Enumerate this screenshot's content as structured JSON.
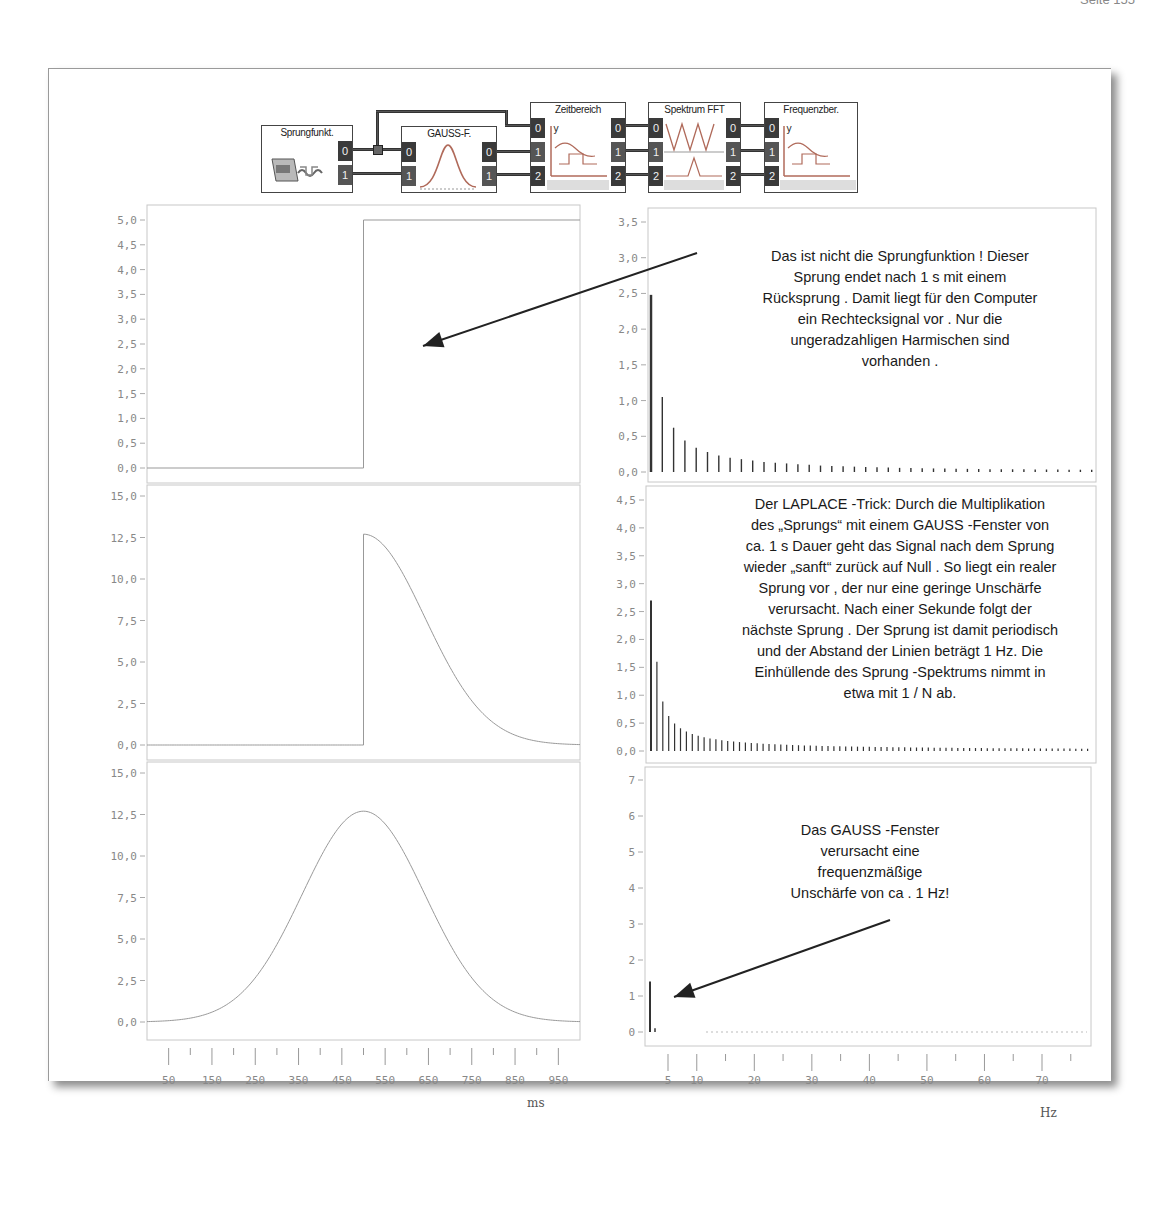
{
  "page": {
    "header_left": "",
    "header_right": "Seite 155"
  },
  "block_diagram": {
    "blocks": [
      {
        "title": "Sprungfunkt.",
        "inputs": [],
        "outputs": [
          "0",
          "1"
        ],
        "icon": "step-function-plug-icon"
      },
      {
        "title": "GAUSS-F.",
        "inputs": [
          "0",
          "1"
        ],
        "outputs": [
          "0",
          "1"
        ],
        "icon": "gauss-curve-icon"
      },
      {
        "title": "Zeitbereich",
        "inputs": [
          "0",
          "1",
          "2"
        ],
        "outputs": [
          "0",
          "1",
          "2"
        ],
        "icon": "time-domain-plot-icon"
      },
      {
        "title": "Spektrum FFT",
        "inputs": [
          "0",
          "1",
          "2"
        ],
        "outputs": [
          "0",
          "1",
          "2"
        ],
        "icon": "fft-spectrum-icon"
      },
      {
        "title": "Frequenzber.",
        "inputs": [
          "0",
          "1",
          "2"
        ],
        "outputs": [],
        "icon": "frequency-domain-plot-icon"
      }
    ]
  },
  "annotations": {
    "top": [
      "Das ist nicht die Sprungfunktion   ! Dieser",
      "Sprung endet nach    1 s mit einem",
      "Rücksprung . Damit liegt für den Computer",
      "ein Rechtecksignal vor  . Nur die",
      "ungeradzahligen Harmischen sind",
      "vorhanden ."
    ],
    "middle": [
      "Der LAPLACE -Trick: Durch die Multiplikation",
      "des „Sprungs“ mit einem GAUSS  -Fenster von",
      "ca. 1 s Dauer geht das Signal nach dem Sprung",
      "wieder „sanft“ zurück auf Null  . So liegt ein realer",
      "Sprung vor  , der nur eine geringe Unschärfe",
      "verursacht. Nach einer Sekunde folgt der",
      "nächste Sprung  . Der Sprung ist damit periodisch",
      "und der Abstand der Linien beträgt     1 Hz. Die",
      "Einhüllende des Sprung   -Spektrums nimmt in",
      "etwa mit 1 / N ab."
    ],
    "bottom": [
      "Das GAUSS -Fenster",
      "verursacht eine",
      "frequenzmäßige",
      "Unschärfe von ca . 1 Hz!"
    ]
  },
  "axes": {
    "time_unit": "ms",
    "freq_unit": "Hz"
  },
  "chart_data": [
    {
      "id": "time-step",
      "type": "line",
      "title": "",
      "xlabel": "ms",
      "ylabel": "",
      "xlim": [
        0,
        1000
      ],
      "ylim": [
        -0.3,
        5.2
      ],
      "yticks": [
        "0,0",
        "0,5",
        "1,0",
        "1,5",
        "2,0",
        "2,5",
        "3,0",
        "3,5",
        "4,0",
        "4,5",
        "5,0"
      ],
      "yticks_values": [
        0,
        0.5,
        1,
        1.5,
        2,
        2.5,
        3,
        3.5,
        4,
        4.5,
        5
      ],
      "series": [
        {
          "name": "Sprungfunktion",
          "x": [
            0,
            500,
            500,
            1000
          ],
          "y": [
            0,
            0,
            5,
            5
          ]
        }
      ],
      "grid": false
    },
    {
      "id": "time-step-gauss",
      "type": "line",
      "title": "",
      "xlabel": "ms",
      "ylabel": "",
      "xlim": [
        0,
        1000
      ],
      "ylim": [
        -0.6,
        15.6
      ],
      "yticks": [
        "0,0",
        "2,5",
        "5,0",
        "7,5",
        "10,0",
        "12,5",
        "15,0"
      ],
      "yticks_values": [
        0,
        2.5,
        5,
        7.5,
        10,
        12.5,
        15
      ],
      "series": [
        {
          "name": "Sprung × GAUSS-Fenster",
          "formula": "x<500 ? 0 : 12.7*exp(-((x-500)/200)^2)",
          "peak": 12.7,
          "step_at": 500
        }
      ],
      "grid": false
    },
    {
      "id": "time-gauss",
      "type": "line",
      "title": "",
      "xlabel": "ms",
      "ylabel": "",
      "xlim": [
        0,
        1000
      ],
      "ylim": [
        -0.6,
        15.6
      ],
      "yticks": [
        "0,0",
        "2,5",
        "5,0",
        "7,5",
        "10,0",
        "12,5",
        "15,0"
      ],
      "yticks_values": [
        0,
        2.5,
        5,
        7.5,
        10,
        12.5,
        15
      ],
      "xticks": [
        "50",
        "150",
        "250",
        "350",
        "450",
        "550",
        "650",
        "750",
        "850",
        "950"
      ],
      "xticks_values": [
        50,
        150,
        250,
        350,
        450,
        550,
        650,
        750,
        850,
        950
      ],
      "series": [
        {
          "name": "GAUSS-Fenster",
          "formula": "12.7*exp(-((x-500)/200)^2)",
          "peak": 12.7,
          "center": 500
        }
      ],
      "grid": false
    },
    {
      "id": "spectrum-step",
      "type": "bar",
      "title": "",
      "xlabel": "Hz",
      "ylabel": "",
      "xlim": [
        0,
        78
      ],
      "ylim": [
        0,
        3.6
      ],
      "yticks": [
        "0,0",
        "0,5",
        "1,0",
        "1,5",
        "2,0",
        "2,5",
        "3,0",
        "3,5"
      ],
      "yticks_values": [
        0,
        0.5,
        1,
        1.5,
        2,
        2.5,
        3,
        3.5
      ],
      "series": [
        {
          "name": "Spektrum Rechteck (ungeradzahlige Harmonische)",
          "x": [
            0,
            1,
            3,
            5,
            7,
            9,
            11,
            13,
            15,
            17,
            19,
            21,
            23,
            25,
            27,
            29,
            31,
            33,
            35,
            37,
            39,
            41,
            43,
            45,
            47,
            49,
            51,
            53,
            55,
            57,
            59,
            61,
            63,
            65,
            67,
            69,
            71,
            73,
            75,
            77
          ],
          "y": [
            2.48,
            1.05,
            0.62,
            0.44,
            0.34,
            0.28,
            0.23,
            0.2,
            0.18,
            0.16,
            0.14,
            0.13,
            0.12,
            0.11,
            0.1,
            0.09,
            0.085,
            0.08,
            0.075,
            0.07,
            0.066,
            0.062,
            0.058,
            0.055,
            0.052,
            0.05,
            0.048,
            0.046,
            0.044,
            0.042,
            0.04,
            0.039,
            0.038,
            0.037,
            0.036,
            0.035,
            0.034,
            0.033,
            0.032,
            0.031
          ]
        }
      ],
      "grid": false
    },
    {
      "id": "spectrum-step-gauss",
      "type": "bar",
      "title": "",
      "xlabel": "Hz",
      "ylabel": "",
      "xlim": [
        0,
        78
      ],
      "ylim": [
        -0.1,
        4.6
      ],
      "yticks": [
        "0,0",
        "0,5",
        "1,0",
        "1,5",
        "2,0",
        "2,5",
        "3,0",
        "3,5",
        "4,0",
        "4,5"
      ],
      "yticks_values": [
        0,
        0.5,
        1,
        1.5,
        2,
        2.5,
        3,
        3.5,
        4,
        4.5
      ],
      "series": [
        {
          "name": "Spektrum Sprung (1 Hz Linienabstand, ~1/N)",
          "spacing_hz": 1,
          "first": 2.7,
          "second": 1.6,
          "decay": "1/N"
        }
      ],
      "grid": false
    },
    {
      "id": "spectrum-gauss",
      "type": "bar",
      "title": "",
      "xlabel": "Hz",
      "ylabel": "",
      "xlim": [
        0,
        78
      ],
      "ylim": [
        -0.3,
        7.4
      ],
      "yticks": [
        "0",
        "1",
        "2",
        "3",
        "4",
        "5",
        "6",
        "7"
      ],
      "yticks_values": [
        0,
        1,
        2,
        3,
        4,
        5,
        6,
        7
      ],
      "xticks": [
        "5",
        "10",
        "20",
        "30",
        "40",
        "50",
        "60",
        "70"
      ],
      "xticks_values": [
        5,
        10,
        20,
        30,
        40,
        50,
        60,
        70
      ],
      "series": [
        {
          "name": "Spektrum GAUSS-Fenster",
          "x": [
            0,
            1
          ],
          "y": [
            1.4,
            0.05
          ]
        }
      ],
      "grid": false
    }
  ]
}
